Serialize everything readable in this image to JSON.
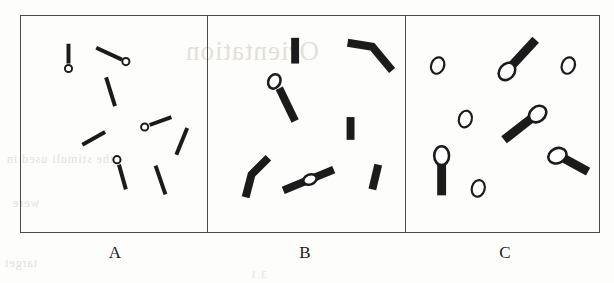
{
  "figure": {
    "title": "",
    "background_color": "#fdfdfc",
    "ink_color": "#1b1b1b",
    "border_color": "#4a4a4a",
    "panel_count": 3
  },
  "bleed_through": {
    "note": "faint mirrored text bleeding through from reverse page of scan",
    "title_line": "Orientation",
    "line_a": "the stimuli used in",
    "line_b": "were",
    "line_c": "target",
    "line_d": "3.1"
  },
  "panels": [
    {
      "id": "panel-a",
      "label": "A",
      "style": "thin-bars-with-small-open-circles",
      "bar_thickness": 4,
      "circle_radius": 3.6,
      "circle_fill": "none",
      "items": [
        {
          "name": "bar-with-circle-1",
          "x1": 48,
          "y1": 28,
          "x2": 48,
          "y2": 48,
          "circle": {
            "cx": 48,
            "cy": 53,
            "r": 3.6
          }
        },
        {
          "name": "bar-with-circle-2",
          "x1": 76,
          "y1": 32,
          "x2": 102,
          "y2": 44,
          "circle": {
            "cx": 106,
            "cy": 46,
            "r": 3.6
          }
        },
        {
          "name": "plain-bar-3",
          "x1": 86,
          "y1": 62,
          "x2": 95,
          "y2": 91
        },
        {
          "name": "plain-bar-4",
          "x1": 62,
          "y1": 130,
          "x2": 85,
          "y2": 117
        },
        {
          "name": "bar-with-circle-5",
          "x1": 130,
          "y1": 110,
          "x2": 152,
          "y2": 102,
          "circle": {
            "cx": 125,
            "cy": 112,
            "r": 3.6
          }
        },
        {
          "name": "plain-bar-6",
          "x1": 157,
          "y1": 140,
          "x2": 168,
          "y2": 113
        },
        {
          "name": "bar-with-circle-7",
          "x1": 99,
          "y1": 150,
          "x2": 106,
          "y2": 175,
          "circle": {
            "cx": 97,
            "cy": 145,
            "r": 3.6
          }
        },
        {
          "name": "plain-bar-8",
          "x1": 136,
          "y1": 151,
          "x2": 146,
          "y2": 180
        }
      ]
    },
    {
      "id": "panel-b",
      "label": "B",
      "style": "thick-bars-bent-pairs-and-ellipses",
      "bar_thickness": 8,
      "ellipse_rx": 5.5,
      "ellipse_ry": 7,
      "items": [
        {
          "name": "plain-bar-1",
          "x1": 88,
          "y1": 22,
          "x2": 88,
          "y2": 48
        },
        {
          "name": "bent-bar-pair-2",
          "x1": 141,
          "y1": 27,
          "x2": 166,
          "y2": 31,
          "x3": 186,
          "y3": 55
        },
        {
          "name": "bar-with-ellipse-3",
          "x1": 72,
          "y1": 73,
          "x2": 88,
          "y2": 106,
          "ellipse": {
            "cx": 67,
            "cy": 66,
            "rx": 6,
            "ry": 7.5,
            "rot": 25
          }
        },
        {
          "name": "plain-bar-4",
          "x1": 144,
          "y1": 102,
          "x2": 144,
          "y2": 125
        },
        {
          "name": "bent-bar-pair-5",
          "x1": 38,
          "y1": 183,
          "x2": 44,
          "y2": 160,
          "x3": 61,
          "y3": 143
        },
        {
          "name": "bar-with-mid-ellipse-6",
          "x1": 76,
          "y1": 176,
          "x2": 127,
          "y2": 155,
          "ellipse": {
            "cx": 103,
            "cy": 165,
            "rx": 7,
            "ry": 5,
            "rot": -22
          }
        },
        {
          "name": "plain-bar-7",
          "x1": 166,
          "y1": 175,
          "x2": 172,
          "y2": 150
        }
      ]
    },
    {
      "id": "panel-c",
      "label": "C",
      "style": "large-open-ellipses-alone-and-on-bars",
      "bar_thickness": 9,
      "ellipse_rx": 7,
      "ellipse_ry": 9,
      "items": [
        {
          "name": "lone-ellipse-1",
          "cx": 32,
          "cy": 50,
          "rx": 6.5,
          "ry": 8.5,
          "rot": 20
        },
        {
          "name": "lone-ellipse-2",
          "cx": 164,
          "cy": 50,
          "rx": 6.5,
          "ry": 8.5,
          "rot": 20
        },
        {
          "name": "bar-with-ellipse-3",
          "x1": 107,
          "y1": 50,
          "x2": 131,
          "y2": 24,
          "ellipse": {
            "cx": 102,
            "cy": 56,
            "rx": 7.5,
            "ry": 9.5,
            "rot": 40
          }
        },
        {
          "name": "lone-ellipse-4",
          "cx": 60,
          "cy": 104,
          "rx": 6.5,
          "ry": 8.5,
          "rot": 15
        },
        {
          "name": "bar-with-ellipse-5",
          "x1": 99,
          "y1": 125,
          "x2": 126,
          "y2": 104,
          "ellipse": {
            "cx": 133,
            "cy": 99,
            "rx": 7.5,
            "ry": 9.5,
            "rot": 50
          }
        },
        {
          "name": "bar-with-ellipse-6",
          "x1": 36,
          "y1": 181,
          "x2": 36,
          "y2": 148,
          "ellipse": {
            "cx": 36,
            "cy": 141,
            "rx": 7.5,
            "ry": 9.5,
            "rot": 0
          }
        },
        {
          "name": "bar-with-ellipse-7",
          "x1": 160,
          "y1": 144,
          "x2": 184,
          "y2": 157,
          "ellipse": {
            "cx": 153,
            "cy": 141,
            "rx": 7.5,
            "ry": 9.5,
            "rot": 65
          }
        },
        {
          "name": "lone-ellipse-8",
          "cx": 73,
          "cy": 174,
          "rx": 6.5,
          "ry": 8.5,
          "rot": 15
        }
      ]
    }
  ]
}
